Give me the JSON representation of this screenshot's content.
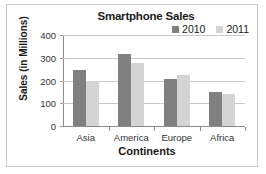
{
  "chart_data": {
    "type": "bar",
    "title": "Smartphone Sales",
    "xlabel": "Continents",
    "ylabel": "Sales (in Millions)",
    "categories": [
      "Asia",
      "America",
      "Europe",
      "Africa"
    ],
    "series": [
      {
        "name": "2010",
        "color": "#808080",
        "values": [
          248,
          317,
          207,
          150
        ]
      },
      {
        "name": "2011",
        "color": "#d4d4d4",
        "values": [
          200,
          277,
          226,
          140
        ]
      }
    ],
    "ylim": [
      0,
      400
    ],
    "yticks": [
      0,
      100,
      200,
      300,
      400
    ],
    "grid": true,
    "legend_position": "top-right",
    "gridline_color": "#c8c8c8",
    "axis_color": "#8a8a8a",
    "border_color": "#c9c9c9"
  }
}
